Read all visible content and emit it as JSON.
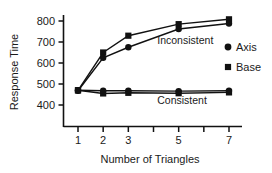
{
  "chart_data": {
    "type": "line",
    "title": "",
    "xlabel": "Number of Triangles",
    "ylabel": "Response Time",
    "x": [
      1,
      2,
      3,
      5,
      7
    ],
    "xtick_labels": [
      "1",
      "2",
      "3",
      "",
      "5",
      "",
      "7"
    ],
    "xtick_positions": [
      1,
      2,
      3,
      4,
      5,
      6,
      7
    ],
    "ytick_labels": [
      "400",
      "500",
      "600",
      "700",
      "800"
    ],
    "ytick_values": [
      400,
      500,
      600,
      700,
      800
    ],
    "ylim": [
      340,
      830
    ],
    "xlim": [
      0.45,
      7.6
    ],
    "grid": false,
    "legend_position": "right",
    "series": [
      {
        "name": "Base",
        "condition": "Inconsistent",
        "marker": "square",
        "color": "#111111",
        "values": [
          470,
          650,
          730,
          785,
          808
        ]
      },
      {
        "name": "Axis",
        "condition": "Inconsistent",
        "marker": "circle",
        "color": "#111111",
        "values": [
          468,
          625,
          675,
          762,
          788
        ]
      },
      {
        "name": "Base",
        "condition": "Consistent",
        "marker": "square",
        "color": "#111111",
        "values": [
          470,
          455,
          458,
          456,
          460
        ]
      },
      {
        "name": "Axis",
        "condition": "Consistent",
        "marker": "circle",
        "color": "#111111",
        "values": [
          470,
          468,
          468,
          466,
          468
        ]
      }
    ],
    "annotations": [
      {
        "text": "Inconsistent",
        "x": 4.15,
        "y": 690
      },
      {
        "text": "Consistent",
        "x": 4.15,
        "y": 405
      }
    ],
    "legend": [
      {
        "label": "Axis",
        "marker": "circle",
        "color": "#111111"
      },
      {
        "label": "Base",
        "marker": "square",
        "color": "#111111"
      }
    ]
  },
  "axis": {
    "line_color": "#111111"
  }
}
